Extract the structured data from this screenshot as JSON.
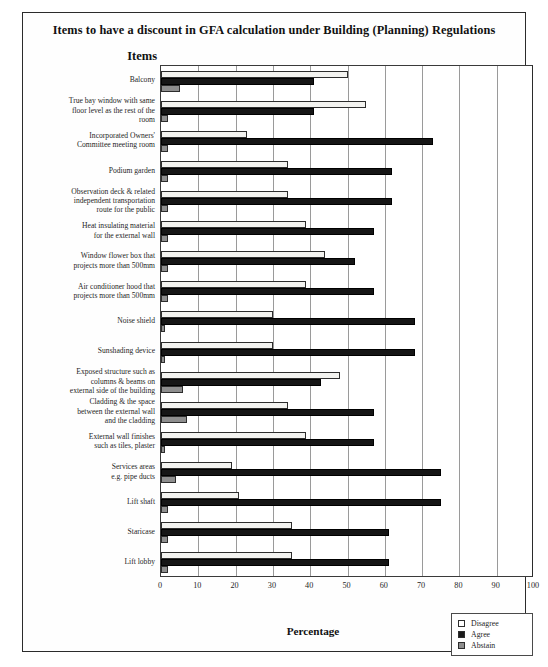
{
  "figure": {
    "title": "Items to have a discount in GFA calculation under Building (Planning) Regulations",
    "items_axis_label": "Items"
  },
  "legend": {
    "position": "bottom-right",
    "entries": [
      {
        "label": "Disagree",
        "swatch": "white-square-icon",
        "color": "#ffffff"
      },
      {
        "label": "Agree",
        "swatch": "black-square-icon",
        "color": "#1a1a1a"
      },
      {
        "label": "Abstain",
        "swatch": "gray-square-icon",
        "color": "#8e8e8e"
      }
    ]
  },
  "chart_data": {
    "type": "bar",
    "orientation": "horizontal",
    "title": "Items to have a discount in GFA calculation under Building (Planning) Regulations",
    "xlabel": "Percentage",
    "ylabel": "Items",
    "xlim": [
      0,
      100
    ],
    "xticks": [
      0,
      10,
      20,
      30,
      40,
      50,
      60,
      70,
      80,
      90,
      100
    ],
    "grid": "vertical",
    "categories": [
      "Balcony",
      "True bay window with same floor level as the rest of the room",
      "Incorporated Owners' Committee meeting room",
      "Podium garden",
      "Observation deck & related independent transportation route for the public",
      "Heat insulating material for the external wall",
      "Window flower box that projects more than 500mm",
      "Air conditioner hood that projects more than 500mm",
      "Noise shield",
      "Sunshading device",
      "Exposed structure such as columns & beams on external side of the building",
      "Cladding & the space between the external wall and the cladding",
      "External wall finishes such as tiles, plaster",
      "Services areas e.g. pipe ducts",
      "Lift shaft",
      "Staricase",
      "Lift lobby"
    ],
    "category_label_lines": [
      [
        "Balcony"
      ],
      [
        "True bay window with same",
        "floor level as the rest of the",
        "room"
      ],
      [
        "Incorporated Owners'",
        "Committee meeting room"
      ],
      [
        "Podium garden"
      ],
      [
        "Observation deck & related",
        "independent transportation",
        "route for the public"
      ],
      [
        "Heat insulating material",
        "for the external wall"
      ],
      [
        "Window flower box that",
        "projects more than 500mm"
      ],
      [
        "Air conditioner hood that",
        "projects more than 500mm"
      ],
      [
        "Noise shield"
      ],
      [
        "Sunshading device"
      ],
      [
        "Exposed structure such as",
        "columns & beams on",
        "external side of the building"
      ],
      [
        "Cladding & the space",
        "between the external wall",
        "and the cladding"
      ],
      [
        "External wall finishes",
        "such as tiles, plaster"
      ],
      [
        "Services areas",
        "e.g. pipe ducts"
      ],
      [
        "Lift shaft"
      ],
      [
        "Staricase"
      ],
      [
        "Lift lobby"
      ]
    ],
    "series": [
      {
        "name": "Disagree",
        "color": "#f3f3f0",
        "values": [
          50,
          55,
          23,
          34,
          34,
          39,
          44,
          39,
          30,
          30,
          48,
          34,
          39,
          19,
          21,
          35,
          35
        ]
      },
      {
        "name": "Agree",
        "color": "#161616",
        "values": [
          41,
          41,
          73,
          62,
          62,
          57,
          52,
          57,
          68,
          68,
          43,
          57,
          57,
          75,
          75,
          61,
          61
        ]
      },
      {
        "name": "Abstain",
        "color": "#8e8e8e",
        "values": [
          5,
          2,
          2,
          2,
          2,
          2,
          2,
          2,
          1,
          1,
          6,
          7,
          1,
          4,
          2,
          2,
          2
        ]
      }
    ]
  }
}
